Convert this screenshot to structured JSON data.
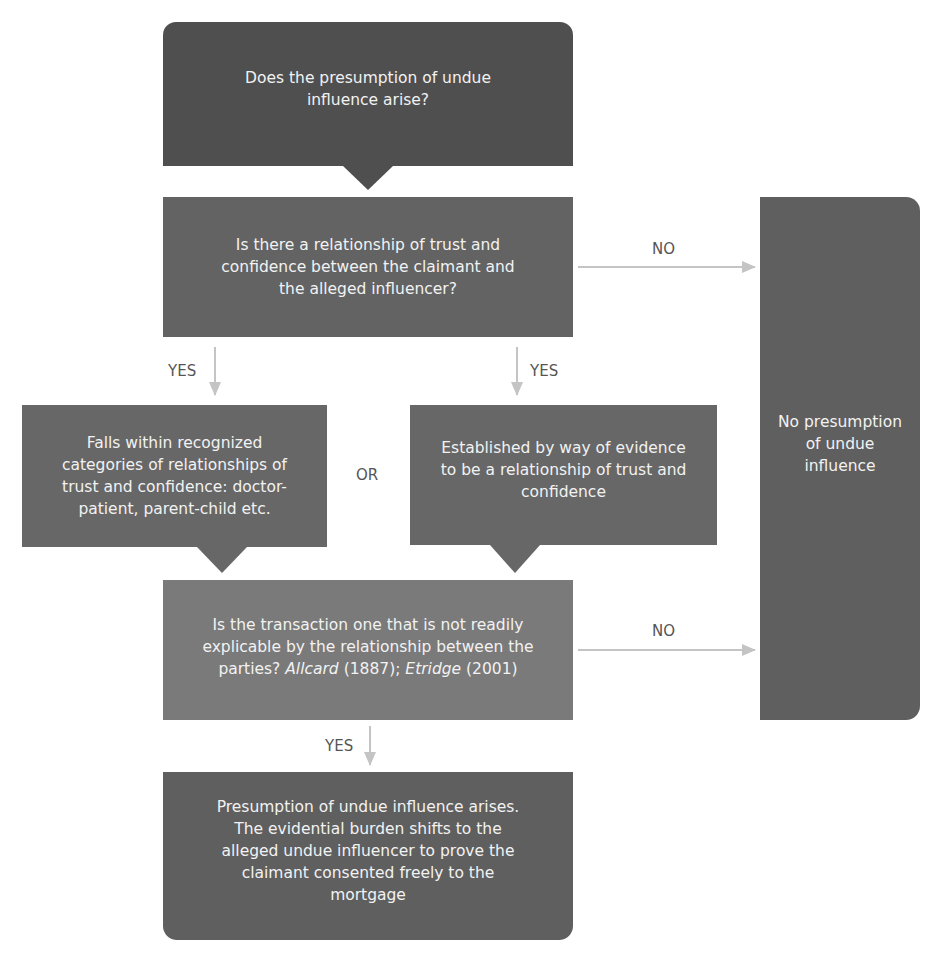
{
  "colors": {
    "start_box": "#4f4f4f",
    "question_box": "#636363",
    "category_box": "#676767",
    "transaction_box": "#7a7a7a",
    "result_box": "#5f5f5f",
    "no_box": "#5f5f5f",
    "arrow": "#c4c4c4",
    "label_text": "#555555",
    "box_text": "#f2f2f2"
  },
  "nodes": {
    "start": {
      "text": "Does the presumption of undue influence arise?"
    },
    "relationship_question": {
      "text": "Is there a relationship of trust and confidence between the claimant and the alleged influencer?"
    },
    "recognized_categories": {
      "text": "Falls within recognized categories of relationships of trust and confidence: doctor-patient, parent-child etc."
    },
    "established_by_evidence": {
      "text": "Established by way of evidence to be a relationship of trust and confidence"
    },
    "transaction_question": {
      "text_before": "Is the transaction one that is not readily explicable by the relationship between the parties? ",
      "case1": "Allcard",
      "case1_year": " (1887); ",
      "case2": "Etridge",
      "case2_year": " (2001)"
    },
    "presumption_arises": {
      "text": "Presumption of undue influence arises. The evidential burden shifts to the alleged undue influencer to prove the claimant consented freely to the mortgage"
    },
    "no_presumption": {
      "text": "No presumption of undue influence"
    }
  },
  "edges": {
    "no_1": "NO",
    "no_2": "NO",
    "yes_left": "YES",
    "yes_right": "YES",
    "or": "OR",
    "yes_bottom": "YES"
  }
}
